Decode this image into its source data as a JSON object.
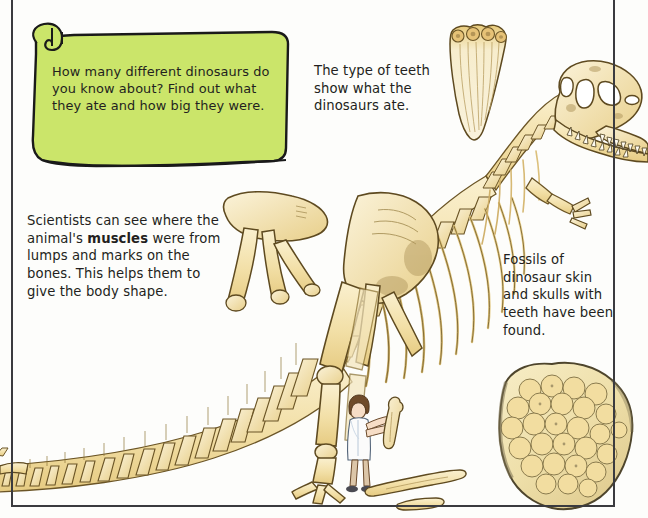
{
  "page": {
    "background_color": "#fdfdfb",
    "frame_color": "#3b3b3f"
  },
  "scroll_banner": {
    "name": "green-scroll-banner",
    "fill_color": "#cbe56a",
    "outline_color": "#1a1a1a",
    "text": "How many different dinosaurs do you know about? Find out what they ate and how big they were."
  },
  "captions": {
    "teeth": {
      "name": "teeth-caption",
      "text": "The type of teeth show what the dinosaurs ate."
    },
    "muscles": {
      "name": "muscles-caption",
      "text_before_bold": "Scientists can see where the animal's ",
      "bold_word": "muscles",
      "text_after_bold": " were from lumps and marks on the bones. This helps them to give the body shape."
    },
    "fossils": {
      "name": "fossils-caption",
      "text": "Fossils of dinosaur skin and skulls with teeth have been found."
    }
  },
  "artwork": {
    "bone_fill_light": "#f7ecc6",
    "bone_fill_mid": "#f0dca0",
    "bone_fill_deep": "#e2c475",
    "bone_outline": "#6b5526",
    "shadow_tint": "#b9a271",
    "skin_tone": "#f2d9c2",
    "hair_color": "#6f4b2a",
    "coat_color": "#fbfbfb",
    "coat_shade": "#cfd9e3",
    "rock_fill": "#f0e4b8",
    "rock_scale_fill": "#efd692",
    "rock_outline": "#5d5338",
    "items": [
      {
        "name": "dinosaur-skeleton",
        "label": "Full theropod dinosaur skeleton in side view"
      },
      {
        "name": "dinosaur-skull",
        "label": "Dinosaur skull with teeth, eye socket and nostril"
      },
      {
        "name": "teeth-detail",
        "label": "Close-up of serrated dinosaur teeth"
      },
      {
        "name": "pelvis-bones",
        "label": "Pelvis and hip bones"
      },
      {
        "name": "rib-cage",
        "label": "Rib cage"
      },
      {
        "name": "tail-vertebrae",
        "label": "Tail vertebrae running off the page"
      },
      {
        "name": "hind-leg",
        "label": "Hind leg with clawed foot"
      },
      {
        "name": "forelimb",
        "label": "Small forelimb with claws"
      },
      {
        "name": "scientist-figure",
        "label": "Scientist in white coat holding a bone, for scale"
      },
      {
        "name": "loose-bones",
        "label": "Loose bones on the ground"
      },
      {
        "name": "fossil-skin-rock",
        "label": "Fossilised dinosaur skin showing scales"
      }
    ]
  }
}
